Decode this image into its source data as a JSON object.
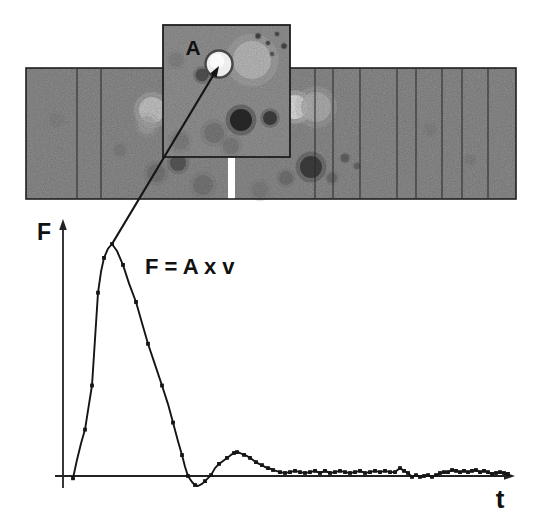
{
  "figure": {
    "background": "#ffffff",
    "colors": {
      "strip_fill": "#8d8d8d",
      "inset_fill": "#929292",
      "strip_border": "#1f1f1f",
      "divider": "#2a2a2a",
      "ink": "#151515",
      "axis": "#222222"
    }
  },
  "strip": {
    "x": 26,
    "y": 68,
    "w": 490,
    "h": 131,
    "divider_x": [
      77,
      101,
      315,
      333,
      360,
      397,
      416,
      442,
      462,
      488
    ],
    "gap": {
      "x": 228,
      "w": 7
    },
    "blobs": [
      {
        "cx": 152,
        "cy": 110,
        "r": 13,
        "fill": "#c9c9c9",
        "op": 0.9
      },
      {
        "cx": 147,
        "cy": 125,
        "r": 9,
        "fill": "#a8a8a8",
        "op": 0.6
      },
      {
        "cx": 178,
        "cy": 163,
        "r": 8,
        "fill": "#555555",
        "op": 0.85
      },
      {
        "cx": 156,
        "cy": 173,
        "r": 9,
        "fill": "#747474",
        "op": 0.8
      },
      {
        "cx": 203,
        "cy": 185,
        "r": 10,
        "fill": "#6f6f6f",
        "op": 0.6
      },
      {
        "cx": 295,
        "cy": 107,
        "r": 12,
        "fill": "#e2e2e2",
        "op": 0.95
      },
      {
        "cx": 316,
        "cy": 107,
        "r": 15,
        "fill": "#b4b4b4",
        "op": 0.85
      },
      {
        "cx": 311,
        "cy": 167,
        "r": 11,
        "fill": "#3c3c3c",
        "op": 0.95
      },
      {
        "cx": 345,
        "cy": 158,
        "r": 4,
        "fill": "#5e5e5e",
        "op": 0.8
      },
      {
        "cx": 357,
        "cy": 166,
        "r": 3,
        "fill": "#646464",
        "op": 0.8
      },
      {
        "cx": 332,
        "cy": 178,
        "r": 5,
        "fill": "#6a6a6a",
        "op": 0.7
      },
      {
        "cx": 286,
        "cy": 178,
        "r": 7,
        "fill": "#6e6e6e",
        "op": 0.7
      },
      {
        "cx": 260,
        "cy": 190,
        "r": 8,
        "fill": "#7a7a7a",
        "op": 0.55
      },
      {
        "cx": 120,
        "cy": 150,
        "r": 6,
        "fill": "#7a7a7a",
        "op": 0.5
      },
      {
        "cx": 56,
        "cy": 120,
        "r": 7,
        "fill": "#828282",
        "op": 0.5
      },
      {
        "cx": 430,
        "cy": 130,
        "r": 6,
        "fill": "#808080",
        "op": 0.5
      },
      {
        "cx": 470,
        "cy": 160,
        "r": 5,
        "fill": "#7d7d7d",
        "op": 0.5
      }
    ]
  },
  "inset": {
    "x": 163,
    "y": 25,
    "w": 127,
    "h": 132,
    "label": "A",
    "label_pos": {
      "x": 193,
      "y": 55
    },
    "vesicle": {
      "cx": 219,
      "cy": 64,
      "r": 13.5
    },
    "blobs": [
      {
        "cx": 252,
        "cy": 60,
        "r": 19,
        "fill": "#bdbdbd",
        "op": 0.9
      },
      {
        "cx": 202,
        "cy": 75,
        "r": 6.5,
        "fill": "#4f4f4f",
        "op": 0.9
      },
      {
        "cx": 241,
        "cy": 120,
        "r": 11,
        "fill": "#262626",
        "op": 0.95
      },
      {
        "cx": 270,
        "cy": 118,
        "r": 7,
        "fill": "#383838",
        "op": 0.9
      },
      {
        "cx": 214,
        "cy": 133,
        "r": 10,
        "fill": "#767676",
        "op": 0.8
      },
      {
        "cx": 231,
        "cy": 146,
        "r": 8,
        "fill": "#7a7a7a",
        "op": 0.8
      },
      {
        "cx": 180,
        "cy": 141,
        "r": 9,
        "fill": "#7b7b7b",
        "op": 0.7
      },
      {
        "cx": 176,
        "cy": 60,
        "r": 7,
        "fill": "#7e7e7e",
        "op": 0.55
      },
      {
        "cx": 258,
        "cy": 36,
        "r": 2.5,
        "fill": "#3f3f3f",
        "op": 0.9
      },
      {
        "cx": 268,
        "cy": 43,
        "r": 2,
        "fill": "#454545",
        "op": 0.9
      },
      {
        "cx": 277,
        "cy": 34,
        "r": 2,
        "fill": "#454545",
        "op": 0.9
      },
      {
        "cx": 284,
        "cy": 46,
        "r": 2.5,
        "fill": "#404040",
        "op": 0.9
      },
      {
        "cx": 272,
        "cy": 54,
        "r": 2,
        "fill": "#4a4a4a",
        "op": 0.8
      }
    ]
  },
  "connector": {
    "x1": 214,
    "y1": 74,
    "x2": 112,
    "y2": 244,
    "arrow": "219,66 216.6,77.4 210.1,73.5"
  },
  "graph": {
    "origin": {
      "x": 63,
      "y": 476
    },
    "f_scale_px": 232,
    "y_axis": {
      "label": "F"
    },
    "x_axis": {
      "label": "t"
    },
    "equation": "F = A x v"
  },
  "chart_data": {
    "type": "line",
    "title": "",
    "xlabel": "t",
    "ylabel": "F",
    "annotation": "F = A x v",
    "legend": null,
    "grid": false,
    "x_unit": "time, arbitrary units (pixels from origin)",
    "y_unit": "force normalized to peak = 1",
    "xlim": [
      0,
      450
    ],
    "ylim": [
      -0.06,
      1.05
    ],
    "points": [
      [
        10,
        -0.01,
        1
      ],
      [
        14,
        0.07,
        0
      ],
      [
        18,
        0.14,
        0
      ],
      [
        22,
        0.2,
        1
      ],
      [
        26,
        0.31,
        0
      ],
      [
        29,
        0.39,
        1
      ],
      [
        32,
        0.59,
        0
      ],
      [
        35,
        0.79,
        1
      ],
      [
        38,
        0.88,
        0
      ],
      [
        41,
        0.94,
        1
      ],
      [
        45,
        0.98,
        0
      ],
      [
        49,
        1.0,
        1
      ],
      [
        54,
        0.97,
        0
      ],
      [
        60,
        0.91,
        1
      ],
      [
        66,
        0.83,
        0
      ],
      [
        73,
        0.75,
        1
      ],
      [
        79,
        0.66,
        0
      ],
      [
        85,
        0.57,
        1
      ],
      [
        92,
        0.48,
        0
      ],
      [
        99,
        0.39,
        1
      ],
      [
        105,
        0.31,
        0
      ],
      [
        110,
        0.23,
        1
      ],
      [
        115,
        0.15,
        0
      ],
      [
        119,
        0.09,
        1
      ],
      [
        122,
        0.04,
        0
      ],
      [
        125,
        0.0,
        1
      ],
      [
        129,
        -0.026,
        0
      ],
      [
        132,
        -0.039,
        1
      ],
      [
        135,
        -0.043,
        0
      ],
      [
        139,
        -0.034,
        0
      ],
      [
        142,
        -0.022,
        1
      ],
      [
        145,
        -0.009,
        0
      ],
      [
        148,
        0.004,
        1
      ],
      [
        152,
        0.034,
        0
      ],
      [
        156,
        0.052,
        1
      ],
      [
        160,
        0.065,
        0
      ],
      [
        164,
        0.078,
        1
      ],
      [
        168,
        0.091,
        0
      ],
      [
        171,
        0.099,
        1
      ],
      [
        174,
        0.103,
        1
      ],
      [
        177,
        0.099,
        0
      ],
      [
        181,
        0.091,
        1
      ],
      [
        184,
        0.086,
        0
      ],
      [
        187,
        0.078,
        1
      ],
      [
        190,
        0.069,
        0
      ],
      [
        193,
        0.06,
        1
      ],
      [
        196,
        0.052,
        0
      ],
      [
        199,
        0.047,
        1
      ],
      [
        202,
        0.039,
        0
      ],
      [
        205,
        0.034,
        1
      ],
      [
        208,
        0.03,
        0
      ],
      [
        210,
        0.026,
        1
      ],
      [
        213,
        0.022,
        0
      ],
      [
        217,
        0.017,
        1
      ],
      [
        222,
        0.013,
        1
      ],
      [
        227,
        0.017,
        1
      ],
      [
        232,
        0.022,
        1
      ],
      [
        237,
        0.017,
        1
      ],
      [
        242,
        0.013,
        1
      ],
      [
        247,
        0.017,
        1
      ],
      [
        252,
        0.022,
        1
      ],
      [
        257,
        0.013,
        1
      ],
      [
        262,
        0.022,
        1
      ],
      [
        267,
        0.013,
        1
      ],
      [
        272,
        0.017,
        1
      ],
      [
        277,
        0.022,
        1
      ],
      [
        282,
        0.017,
        1
      ],
      [
        287,
        0.013,
        1
      ],
      [
        292,
        0.017,
        1
      ],
      [
        297,
        0.022,
        1
      ],
      [
        302,
        0.013,
        1
      ],
      [
        307,
        0.017,
        1
      ],
      [
        312,
        0.022,
        1
      ],
      [
        317,
        0.017,
        1
      ],
      [
        322,
        0.022,
        1
      ],
      [
        327,
        0.017,
        1
      ],
      [
        332,
        0.017,
        1
      ],
      [
        337,
        0.034,
        1
      ],
      [
        341,
        0.022,
        1
      ],
      [
        345,
        0.013,
        1
      ],
      [
        349,
        -0.004,
        1
      ],
      [
        353,
        0.004,
        1
      ],
      [
        357,
        -0.004,
        1
      ],
      [
        361,
        0.0,
        1
      ],
      [
        365,
        0.004,
        1
      ],
      [
        369,
        -0.004,
        1
      ],
      [
        373,
        0.004,
        1
      ],
      [
        377,
        0.013,
        1
      ],
      [
        381,
        0.017,
        1
      ],
      [
        385,
        0.017,
        1
      ],
      [
        389,
        0.026,
        1
      ],
      [
        393,
        0.022,
        1
      ],
      [
        397,
        0.017,
        1
      ],
      [
        401,
        0.022,
        1
      ],
      [
        405,
        0.017,
        1
      ],
      [
        409,
        0.022,
        1
      ],
      [
        413,
        0.026,
        1
      ],
      [
        417,
        0.017,
        1
      ],
      [
        421,
        0.022,
        1
      ],
      [
        425,
        0.017,
        1
      ],
      [
        429,
        0.009,
        1
      ],
      [
        433,
        0.013,
        1
      ],
      [
        437,
        0.017,
        1
      ],
      [
        441,
        0.013,
        1
      ],
      [
        445,
        0.009,
        1
      ]
    ]
  }
}
